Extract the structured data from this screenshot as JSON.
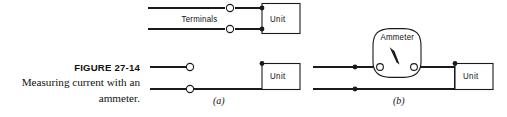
{
  "figure": {
    "caption": {
      "number_label": "FIGURE 27-14",
      "description_line_1": "Measuring current with an",
      "description_line_2": "ammeter."
    },
    "diagrams": [
      {
        "id": "top",
        "sublabel": "",
        "labels": {
          "terminals": "Terminals",
          "unit": "Unit"
        }
      },
      {
        "id": "a",
        "sublabel": "(a)",
        "labels": {
          "unit": "Unit"
        }
      },
      {
        "id": "b",
        "sublabel": "(b)",
        "labels": {
          "ammeter": "Ammeter",
          "unit": "Unit"
        }
      }
    ],
    "colors": {
      "ink": "#1a1a1a",
      "paper": "#ffffff"
    },
    "icons": {
      "open_terminal": "open-circle-terminal",
      "solid_junction": "solid-dot-junction",
      "meter_needle": "needle-pointer"
    }
  }
}
